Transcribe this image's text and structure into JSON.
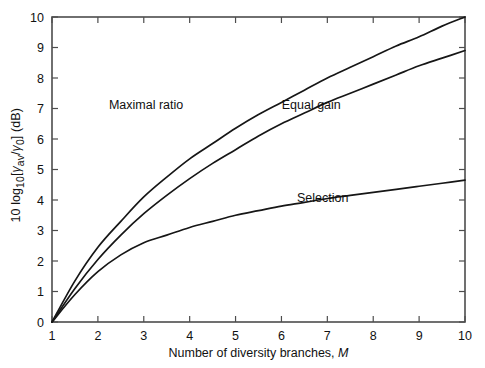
{
  "chart_data": {
    "type": "line",
    "title": "",
    "xlabel": "Number of diversity branches, M",
    "xlabel_plain": "Number of diversity branches,",
    "xlabel_italic": "M",
    "ylabel": "10 log10[γav/γ0] (dB)",
    "ylabel_parts": {
      "lead": "10 log",
      "log_sub": "10",
      "bracket_open": "[",
      "gamma1": "γ",
      "gamma1_sub": "av",
      "slash": "/",
      "gamma2": "γ",
      "gamma2_sub": "0",
      "bracket_close": "]",
      "units": " (dB)"
    },
    "xlim": [
      1,
      10
    ],
    "ylim": [
      0,
      10
    ],
    "xticks": [
      1,
      2,
      3,
      4,
      5,
      6,
      7,
      8,
      9,
      10
    ],
    "yticks": [
      0,
      1,
      2,
      3,
      4,
      5,
      6,
      7,
      8,
      9,
      10
    ],
    "xticklabels": [
      "1",
      "2",
      "3",
      "4",
      "5",
      "6",
      "7",
      "8",
      "9",
      "10"
    ],
    "yticklabels": [
      "0",
      "1",
      "2",
      "3",
      "4",
      "5",
      "6",
      "7",
      "8",
      "9",
      "10"
    ],
    "grid": false,
    "legend_position": "inline-annotations",
    "line_color": "#161616",
    "axis_color": "#4d4d4d",
    "background": "#ffffff",
    "x": [
      1,
      1.5,
      2,
      2.5,
      3,
      3.5,
      4,
      4.5,
      5,
      5.5,
      6,
      6.5,
      7,
      7.5,
      8,
      8.5,
      9,
      9.5,
      10
    ],
    "series": [
      {
        "name": "Maximal ratio",
        "label": "Maximal ratio",
        "label_x": 3.05,
        "label_y": 7.0,
        "values": [
          0,
          1.35,
          2.45,
          3.3,
          4.1,
          4.75,
          5.35,
          5.85,
          6.35,
          6.8,
          7.2,
          7.6,
          8.0,
          8.35,
          8.7,
          9.05,
          9.35,
          9.7,
          10.0
        ]
      },
      {
        "name": "Equal gain",
        "label": "Equal gain",
        "label_x": 6.65,
        "label_y": 7.0,
        "values": [
          0,
          1.1,
          2.05,
          2.85,
          3.55,
          4.15,
          4.7,
          5.2,
          5.65,
          6.1,
          6.5,
          6.85,
          7.2,
          7.5,
          7.8,
          8.1,
          8.4,
          8.65,
          8.9
        ]
      },
      {
        "name": "Selection",
        "label": "Selection",
        "label_x": 6.9,
        "label_y": 3.95,
        "values": [
          0,
          0.9,
          1.65,
          2.2,
          2.6,
          2.85,
          3.1,
          3.3,
          3.5,
          3.65,
          3.8,
          3.92,
          4.05,
          4.15,
          4.25,
          4.35,
          4.45,
          4.55,
          4.65
        ]
      }
    ],
    "annotations": [
      {
        "text": "Maximal ratio",
        "x": 3.05,
        "y": 7.0
      },
      {
        "text": "Equal gain",
        "x": 6.65,
        "y": 7.0
      },
      {
        "text": "Selection",
        "x": 6.9,
        "y": 3.95
      }
    ]
  }
}
